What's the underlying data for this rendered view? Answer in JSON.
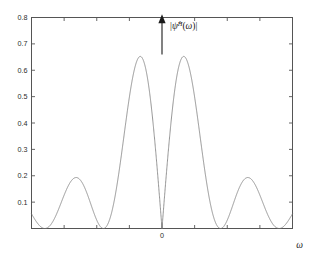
{
  "figure": {
    "background_color": "#ffffff",
    "axes_color": "#555555",
    "curve_color": "#7a7a7a",
    "annotation_color": "#1a1a1a"
  },
  "labels": {
    "xlabel": "ω",
    "curve_label_parts": {
      "open_bar": "|",
      "psi_hat": "ψ̂",
      "superscript": "H",
      "arg_open": "(",
      "omega": "ω",
      "arg_close": ")",
      "close_bar": "|"
    },
    "curve_label_plain": "|ψ̂^H(ω)|",
    "arrow_marker": "impulse-arrow-at-zero"
  },
  "chart_data": {
    "type": "line",
    "title": "",
    "subtitle": "",
    "xlabel": "ω",
    "ylabel": "",
    "grid": false,
    "legend": null,
    "box_frame": true,
    "tick_direction": "in",
    "xlim": [
      -28.0,
      28.0
    ],
    "ylim": [
      0.0,
      0.8
    ],
    "xticks": [
      0
    ],
    "xticklabels": [
      "0"
    ],
    "yticks": [
      0.1,
      0.2,
      0.3,
      0.4,
      0.5,
      0.6,
      0.7,
      0.8
    ],
    "yticklabels": [
      "0.1",
      "0.2",
      "0.3",
      "0.4",
      "0.5",
      "0.6",
      "0.7",
      "0.8"
    ],
    "series": [
      {
        "name": "|ψ̂^H(ω)|",
        "description": "Magnitude of the Fourier transform of the Haar wavelet: |sin^2(w/4)/(w/4)| scaled, zero at w=0, twin main lobes near w=±2.6 reaching 0.72, side lobes decaying as 1/w.",
        "formula": "abs(sin(w/4)^2 / (w/4)) * 0.9003",
        "peak_value": 0.72,
        "peak_positions": [
          -2.6,
          2.6
        ],
        "zero_at_origin": 0.0,
        "sidelobe_peaks_right": [
          {
            "x": 6.6,
            "y": 0.212
          },
          {
            "x": 10.5,
            "y": 0.125
          },
          {
            "x": 14.4,
            "y": 0.085
          },
          {
            "x": 18.3,
            "y": 0.062
          },
          {
            "x": 22.2,
            "y": 0.049
          },
          {
            "x": 26.0,
            "y": 0.041
          }
        ],
        "sidelobe_peaks_left": [
          {
            "x": -6.6,
            "y": 0.212
          },
          {
            "x": -10.5,
            "y": 0.125
          },
          {
            "x": -14.4,
            "y": 0.085
          },
          {
            "x": -18.3,
            "y": 0.062
          },
          {
            "x": -22.2,
            "y": 0.049
          },
          {
            "x": -26.0,
            "y": 0.041
          }
        ],
        "zero_crossings": [
          -25.1,
          -18.8,
          -12.6,
          -6.3,
          0.0,
          6.3,
          12.6,
          18.8,
          25.1
        ]
      }
    ],
    "annotations": [
      {
        "type": "arrow",
        "text": "|ψ̂^H(ω)|",
        "x": 0.0,
        "direction": "up",
        "y_start": 0.66,
        "y_end": 0.79
      }
    ]
  }
}
